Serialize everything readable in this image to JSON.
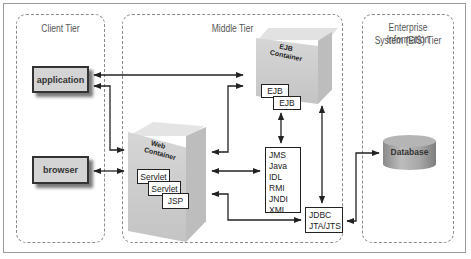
{
  "tiers": {
    "client": {
      "title": "Client Tier"
    },
    "middle": {
      "title": "Middle Tier"
    },
    "eis": {
      "title_line1": "Enterprise Information",
      "title_line2": "System (EIS) Tier"
    }
  },
  "clients": [
    {
      "label": "application"
    },
    {
      "label": "browser"
    }
  ],
  "ejb_container": {
    "label_line1": "EJB",
    "label_line2": "Container",
    "components": [
      "EJB",
      "EJB"
    ]
  },
  "web_container": {
    "label_line1": "Web",
    "label_line2": "Container",
    "components": [
      "Servlet",
      "Servlet",
      "JSP"
    ]
  },
  "services_box": {
    "items": [
      "JMS",
      "Java IDL",
      "RMI",
      "JNDI",
      "XML"
    ]
  },
  "jdbc_box": {
    "items": [
      "JDBC",
      "JTA/JTS"
    ]
  },
  "database": {
    "label": "Database"
  },
  "colors": {
    "border": "#222222",
    "dashed": "#8a8a8a",
    "container": "#d0d0d0",
    "client_fill": "#d4d4d4"
  }
}
